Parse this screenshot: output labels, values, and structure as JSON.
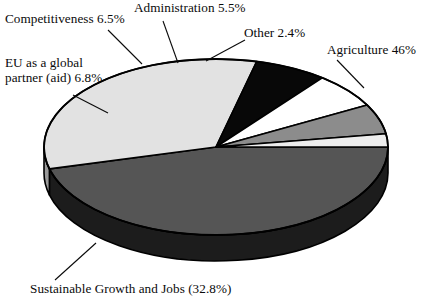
{
  "chart_data": {
    "type": "pie",
    "title": "",
    "subtitle": "",
    "xlabel": "",
    "ylabel": "",
    "legend_position": "none",
    "grid": false,
    "style": "3d-exploded-none",
    "categories": [
      "Agriculture",
      "Sustainable Growth and Jobs",
      "EU as a global partner (aid)",
      "Competitiveness",
      "Administration",
      "Other"
    ],
    "values": [
      46,
      32.8,
      6.8,
      6.5,
      5.5,
      2.4
    ],
    "value_suffix": "%",
    "slices": [
      {
        "name": "Agriculture",
        "label": "Agriculture 46%",
        "value": 46,
        "value_text": "46%",
        "top_color": "#555555",
        "side_color": "#1c1c1c",
        "start_deg": 0,
        "sweep_deg": 165.6
      },
      {
        "name": "Sustainable Growth and Jobs",
        "label": "Sustainable Growth and Jobs (32.8%)",
        "value": 32.8,
        "value_text": "32.8%",
        "top_color": "#e2e2e2",
        "side_color": "#9a9a9a",
        "start_deg": 165.6,
        "sweep_deg": 118.08
      },
      {
        "name": "EU as a global partner (aid)",
        "label": "EU as a global partner (aid) 6.8%",
        "value": 6.8,
        "value_text": "6.8%",
        "top_color": "#080808",
        "side_color": "#000000",
        "start_deg": 283.68,
        "sweep_deg": 24.48
      },
      {
        "name": "Competitiveness",
        "label": "Competitiveness 6.5%",
        "value": 6.5,
        "value_text": "6.5%",
        "top_color": "#ffffff",
        "side_color": "#d2d2d2",
        "start_deg": 308.16,
        "sweep_deg": 23.4
      },
      {
        "name": "Administration",
        "label": "Administration 5.5%",
        "value": 5.5,
        "value_text": "5.5%",
        "top_color": "#8c8c8c",
        "side_color": "#5a5a5a",
        "start_deg": 331.56,
        "sweep_deg": 19.8
      },
      {
        "name": "Other",
        "label": "Other 2.4%",
        "value": 2.4,
        "value_text": "2.4%",
        "top_color": "#ededed",
        "side_color": "#b0b0b0",
        "start_deg": 351.36,
        "sweep_deg": 8.64
      }
    ]
  },
  "labels": {
    "competitiveness": "Competitiveness 6.5%",
    "administration": "Administration 5.5%",
    "other": "Other 2.4%",
    "agriculture": "Agriculture 46%",
    "eu_partner": "EU as a global partner (aid) 6.8%",
    "sustainable": "Sustainable Growth and Jobs (32.8%)"
  },
  "geometry": {
    "center_x": 216,
    "center_y": 147,
    "radius_x": 172,
    "radius_y": 88,
    "depth": 26
  },
  "colors": {
    "background": "#ffffff",
    "outline": "#000000",
    "text": "#0a0a0a"
  }
}
